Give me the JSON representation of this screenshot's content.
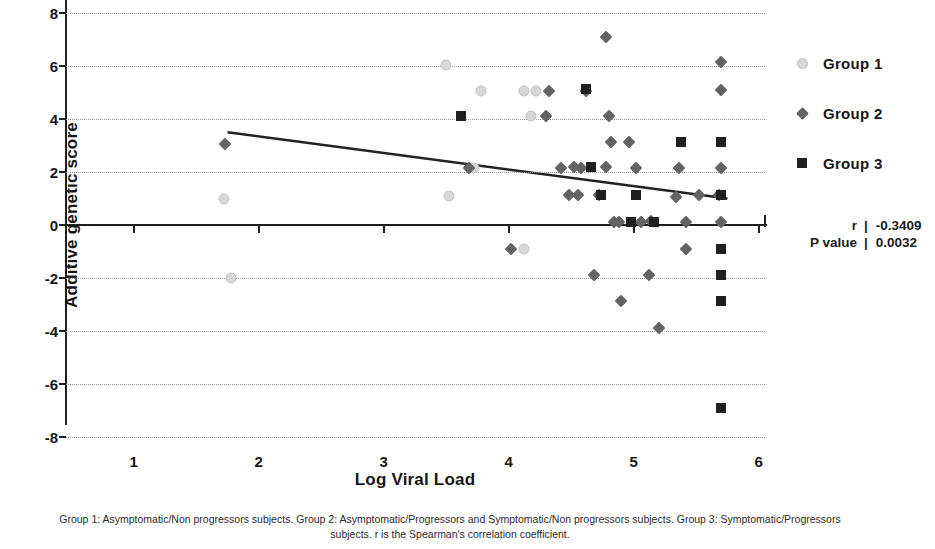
{
  "chart_data": {
    "type": "scatter",
    "title": "",
    "xlabel": "Log Viral Load",
    "ylabel": "Additive genetic score",
    "xlim": [
      0.45,
      6.05
    ],
    "ylim": [
      -8,
      8
    ],
    "xticks": [
      1,
      2,
      3,
      4,
      5,
      6
    ],
    "yticks": [
      8,
      6,
      4,
      2,
      0,
      -2,
      -4,
      -6,
      -8
    ],
    "grid": "horizontal-dotted",
    "legend_position": "right",
    "series": [
      {
        "name": "Group 1",
        "marker": "circle",
        "color": "#d8d8d8",
        "points": [
          [
            1.72,
            1.0
          ],
          [
            1.78,
            -2.0
          ],
          [
            3.5,
            6.05
          ],
          [
            3.52,
            1.1
          ],
          [
            3.72,
            2.15
          ],
          [
            3.78,
            5.05
          ],
          [
            4.12,
            5.05
          ],
          [
            4.22,
            5.05
          ],
          [
            4.18,
            4.1
          ],
          [
            4.12,
            -0.9
          ]
        ]
      },
      {
        "name": "Group 2",
        "marker": "diamond",
        "color": "#636363",
        "points": [
          [
            1.73,
            3.05
          ],
          [
            3.68,
            2.15
          ],
          [
            4.02,
            -0.9
          ],
          [
            4.32,
            5.05
          ],
          [
            4.3,
            4.1
          ],
          [
            4.42,
            2.15
          ],
          [
            4.48,
            1.15
          ],
          [
            4.62,
            5.05
          ],
          [
            4.58,
            2.15
          ],
          [
            4.55,
            1.15
          ],
          [
            4.52,
            2.2
          ],
          [
            4.72,
            1.15
          ],
          [
            4.68,
            -1.9
          ],
          [
            4.78,
            7.1
          ],
          [
            4.8,
            4.1
          ],
          [
            4.82,
            3.15
          ],
          [
            4.78,
            2.2
          ],
          [
            4.84,
            0.1
          ],
          [
            4.88,
            0.1
          ],
          [
            4.9,
            -2.85
          ],
          [
            4.96,
            3.15
          ],
          [
            5.02,
            2.15
          ],
          [
            5.06,
            0.1
          ],
          [
            5.14,
            0.15
          ],
          [
            5.12,
            -1.9
          ],
          [
            5.2,
            -3.9
          ],
          [
            5.36,
            2.15
          ],
          [
            5.34,
            1.05
          ],
          [
            5.42,
            0.1
          ],
          [
            5.42,
            -0.9
          ],
          [
            5.52,
            1.15
          ],
          [
            5.7,
            6.15
          ],
          [
            5.7,
            5.1
          ],
          [
            5.7,
            2.15
          ],
          [
            5.68,
            1.15
          ],
          [
            5.7,
            0.1
          ]
        ]
      },
      {
        "name": "Group 3",
        "marker": "square",
        "color": "#202020",
        "points": [
          [
            3.62,
            4.1
          ],
          [
            4.62,
            5.15
          ],
          [
            4.66,
            2.2
          ],
          [
            4.74,
            1.15
          ],
          [
            4.98,
            0.1
          ],
          [
            5.02,
            1.15
          ],
          [
            5.16,
            0.1
          ],
          [
            5.38,
            3.15
          ],
          [
            5.7,
            3.15
          ],
          [
            5.7,
            1.12
          ],
          [
            5.7,
            -0.9
          ],
          [
            5.7,
            -1.9
          ],
          [
            5.7,
            -2.85
          ],
          [
            5.7,
            -6.9
          ]
        ]
      }
    ],
    "trend_line": {
      "x_start": 1.75,
      "y_start": 3.5,
      "x_end": 5.75,
      "y_end": 1.0
    }
  },
  "legend": {
    "items": [
      {
        "label": "Group 1",
        "marker": "circle-icon"
      },
      {
        "label": "Group 2",
        "marker": "diamond-icon"
      },
      {
        "label": "Group 3",
        "marker": "square-icon"
      }
    ]
  },
  "stats": {
    "r_label": "r",
    "r_value": "-0.3409",
    "p_label": "P value",
    "p_value": "0.0032",
    "separator": "|"
  },
  "caption": {
    "line1": "Group 1: Asymptomatic/Non progressors subjects. Group 2: Asymptomatic/Progressors and Symptomatic/Non progressors",
    "line2": "subjects. Group 3: Symptomatic/Progressors subjects. r is the Spearman's correlation coefficient."
  }
}
